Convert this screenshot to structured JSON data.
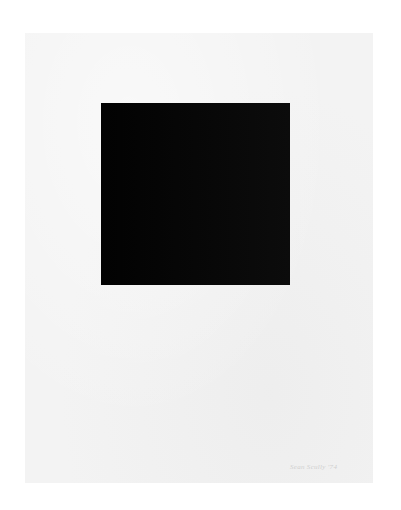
{
  "artwork": {
    "paper_color": "#f3f3f3",
    "square_color": "#050505",
    "signature_text": "Sean Scully '74"
  }
}
